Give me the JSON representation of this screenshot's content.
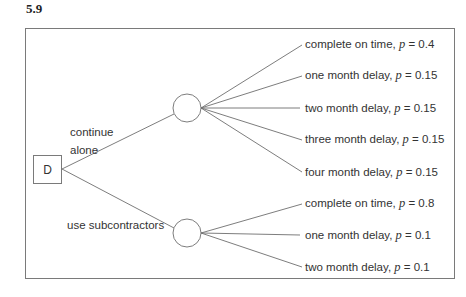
{
  "figure_number": "5.9",
  "decision_node": {
    "label": "D"
  },
  "branches": [
    {
      "label_line1": "continue",
      "label_line2": "alone",
      "outcomes": [
        {
          "text": "complete on time, ",
          "p": "0.4"
        },
        {
          "text": "one month delay, ",
          "p": "0.15"
        },
        {
          "text": "two month delay, ",
          "p": "0.15"
        },
        {
          "text": "three month delay, ",
          "p": "0.15"
        },
        {
          "text": "four month delay, ",
          "p": "0.15"
        }
      ]
    },
    {
      "label": "use subcontractors",
      "outcomes": [
        {
          "text": "complete on time, ",
          "p": "0.8"
        },
        {
          "text": "one month delay, ",
          "p": "0.1"
        },
        {
          "text": "two month delay, ",
          "p": "0.1"
        }
      ]
    }
  ],
  "prob_symbol": "p",
  "equals": " = "
}
